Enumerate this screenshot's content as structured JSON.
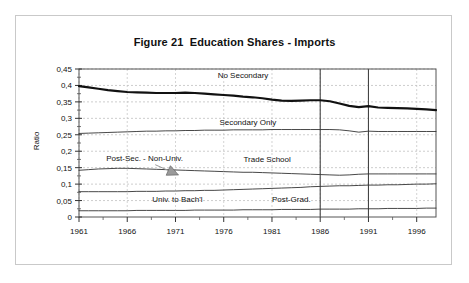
{
  "figure": {
    "title": "Figure 21  Education Shares - Imports",
    "border_color": "#c9c9c9",
    "background": "#ffffff"
  },
  "chart_data": {
    "type": "line",
    "title": "Figure 21  Education Shares - Imports",
    "xlabel": "",
    "ylabel": "Ratio",
    "xlim": [
      1961,
      1998
    ],
    "ylim": [
      0,
      0.45
    ],
    "grid": true,
    "legend_position": "inline-annotations",
    "decimal_separator": ",",
    "ytick_labels": [
      "0,45",
      "0,4",
      "0,35",
      "0,3",
      "0,25",
      "0,2",
      "0,15",
      "0,1",
      "0,05",
      "0"
    ],
    "ytick_values": [
      0.45,
      0.4,
      0.35,
      0.3,
      0.25,
      0.2,
      0.15,
      0.1,
      0.05,
      0
    ],
    "xtick_labels": [
      "1961",
      "1966",
      "1971",
      "1976",
      "1981",
      "1986",
      "1991",
      "1996"
    ],
    "xtick_values": [
      1961,
      1966,
      1971,
      1976,
      1981,
      1986,
      1991,
      1996
    ],
    "x": [
      1961,
      1962,
      1963,
      1964,
      1965,
      1966,
      1967,
      1968,
      1969,
      1970,
      1971,
      1972,
      1973,
      1974,
      1975,
      1976,
      1977,
      1978,
      1979,
      1980,
      1981,
      1982,
      1983,
      1984,
      1985,
      1986,
      1987,
      1988,
      1989,
      1990,
      1991,
      1992,
      1993,
      1994,
      1995,
      1996,
      1997,
      1998
    ],
    "series": [
      {
        "name": "No Secondary",
        "style": "thick",
        "color": "#111111",
        "values": [
          0.398,
          0.394,
          0.39,
          0.386,
          0.383,
          0.38,
          0.379,
          0.378,
          0.377,
          0.377,
          0.377,
          0.378,
          0.377,
          0.375,
          0.373,
          0.371,
          0.369,
          0.366,
          0.364,
          0.361,
          0.357,
          0.354,
          0.353,
          0.354,
          0.355,
          0.355,
          0.352,
          0.345,
          0.338,
          0.334,
          0.337,
          0.333,
          0.332,
          0.331,
          0.33,
          0.329,
          0.327,
          0.325
        ]
      },
      {
        "name": "Secondary  Only",
        "style": "thin",
        "color": "#333333",
        "values": [
          0.254,
          0.255,
          0.256,
          0.257,
          0.258,
          0.259,
          0.26,
          0.261,
          0.261,
          0.262,
          0.262,
          0.263,
          0.263,
          0.264,
          0.264,
          0.264,
          0.265,
          0.265,
          0.265,
          0.265,
          0.266,
          0.266,
          0.266,
          0.266,
          0.266,
          0.266,
          0.266,
          0.265,
          0.262,
          0.258,
          0.261,
          0.26,
          0.26,
          0.26,
          0.26,
          0.26,
          0.26,
          0.26
        ]
      },
      {
        "name": "Trade School",
        "style": "thin",
        "color": "#333333",
        "values": [
          0.142,
          0.144,
          0.146,
          0.147,
          0.148,
          0.148,
          0.147,
          0.146,
          0.145,
          0.144,
          0.143,
          0.142,
          0.141,
          0.14,
          0.139,
          0.138,
          0.137,
          0.136,
          0.136,
          0.135,
          0.134,
          0.133,
          0.132,
          0.131,
          0.13,
          0.129,
          0.128,
          0.127,
          0.128,
          0.13,
          0.131,
          0.131,
          0.131,
          0.131,
          0.131,
          0.131,
          0.131,
          0.131
        ]
      },
      {
        "name": "Univ. to Bach'l",
        "style": "thin",
        "color": "#333333",
        "values": [
          0.077,
          0.077,
          0.077,
          0.077,
          0.077,
          0.077,
          0.078,
          0.078,
          0.078,
          0.079,
          0.079,
          0.08,
          0.08,
          0.081,
          0.081,
          0.082,
          0.083,
          0.084,
          0.085,
          0.086,
          0.087,
          0.088,
          0.089,
          0.09,
          0.092,
          0.093,
          0.094,
          0.095,
          0.095,
          0.096,
          0.097,
          0.097,
          0.098,
          0.098,
          0.099,
          0.1,
          0.1,
          0.101
        ]
      },
      {
        "name": "Post-Grad.",
        "style": "thin",
        "color": "#333333",
        "values": [
          0.019,
          0.019,
          0.019,
          0.019,
          0.019,
          0.019,
          0.02,
          0.02,
          0.02,
          0.02,
          0.02,
          0.02,
          0.021,
          0.021,
          0.021,
          0.021,
          0.021,
          0.022,
          0.022,
          0.022,
          0.022,
          0.023,
          0.023,
          0.023,
          0.023,
          0.024,
          0.024,
          0.024,
          0.024,
          0.025,
          0.025,
          0.025,
          0.026,
          0.026,
          0.026,
          0.026,
          0.027,
          0.027
        ]
      }
    ],
    "reference_lines": [
      {
        "x": 1986,
        "orientation": "vertical",
        "color": "#444444"
      },
      {
        "x": 1991,
        "orientation": "vertical",
        "color": "#444444"
      }
    ],
    "annotations": [
      {
        "text": "No Secondary",
        "x": 1978.0,
        "y": 0.424,
        "align": "middle"
      },
      {
        "text": "Secondary  Only",
        "x": 1978.5,
        "y": 0.281,
        "align": "middle"
      },
      {
        "text": "Post-Sec. - Non-Univ.",
        "x": 1967.8,
        "y": 0.17,
        "align": "middle"
      },
      {
        "text": "Trade School",
        "x": 1980.5,
        "y": 0.168,
        "align": "middle"
      },
      {
        "text": "Univ. to Bach'l",
        "x": 1971.2,
        "y": 0.047,
        "align": "middle"
      },
      {
        "text": "Post-Grad.",
        "x": 1983.0,
        "y": 0.047,
        "align": "middle"
      }
    ],
    "arrow": {
      "name": "post-sec-non-univ-arrow",
      "from": {
        "x": 1968.9,
        "y": 0.159
      },
      "to": {
        "x": 1971.3,
        "y": 0.128
      },
      "color": "#9a9a9a"
    }
  }
}
